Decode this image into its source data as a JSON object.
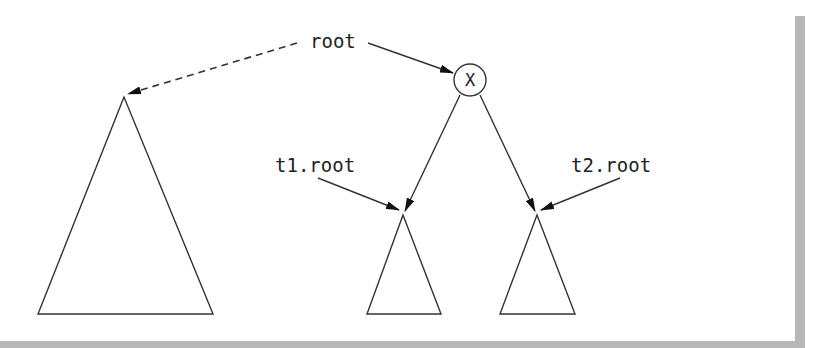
{
  "diagram": {
    "type": "tree-merge",
    "labels": {
      "root": "root",
      "t1_root": "t1.root",
      "t2_root": "t2.root",
      "node_x": "X"
    },
    "colors": {
      "stroke": "#333333",
      "text": "#222222",
      "frame": "#b8b8b8",
      "background": "#ffffff"
    },
    "nodes": [
      {
        "id": "x",
        "label": "X",
        "shape": "circle"
      },
      {
        "id": "old-tree",
        "shape": "triangle",
        "size": "large"
      },
      {
        "id": "t1",
        "shape": "triangle",
        "size": "small"
      },
      {
        "id": "t2",
        "shape": "triangle",
        "size": "small"
      }
    ],
    "edges": [
      {
        "from": "root",
        "to": "old-tree",
        "style": "dashed"
      },
      {
        "from": "root",
        "to": "x",
        "style": "solid"
      },
      {
        "from": "x",
        "to": "t1",
        "style": "solid"
      },
      {
        "from": "x",
        "to": "t2",
        "style": "solid"
      },
      {
        "from": "t1.root",
        "to": "t1",
        "style": "solid"
      },
      {
        "from": "t2.root",
        "to": "t2",
        "style": "solid"
      }
    ]
  }
}
